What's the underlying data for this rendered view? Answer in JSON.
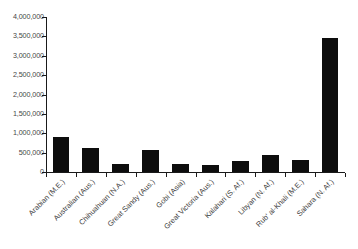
{
  "chart_data": {
    "type": "bar",
    "title": "",
    "xlabel": "",
    "ylabel": "",
    "grid": false,
    "legend": "none",
    "ylim": [
      0,
      4000000
    ],
    "categories": [
      "Arabian (M.E.)",
      "Australian (Aus.)",
      "Chihuahuan (N.A.)",
      "Great Sandy (Aus.)",
      "Gobi (Asia)",
      "Great Victoria (Aus.)",
      "Kalahari (S. Af.)",
      "Libyan (N. Af.)",
      "Rub' al-Khali (M.E.)",
      "Sahara (N. Af.)"
    ],
    "values": [
      900000,
      620000,
      200000,
      570000,
      200000,
      180000,
      280000,
      430000,
      300000,
      3450000
    ],
    "ytick_labels": [
      "4,000,000",
      "3,500,000",
      "3,000,000",
      "2,500,000",
      "2,000,000",
      "1,500,000",
      "1,000,000",
      "500,000",
      "0"
    ],
    "ytick_values": [
      4000000,
      3500000,
      3000000,
      2500000,
      2000000,
      1500000,
      1000000,
      500000,
      0
    ],
    "bar_color": "#0d0d0d",
    "axis_color": "#1a1a1a",
    "background_color": "#ffffff"
  }
}
